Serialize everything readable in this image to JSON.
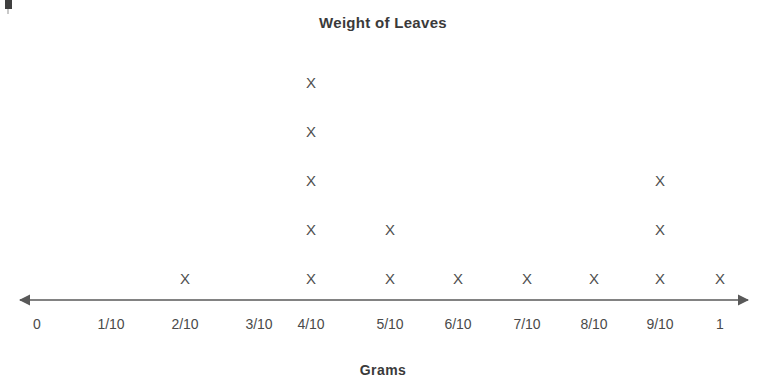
{
  "chart_data": {
    "type": "scatter",
    "plot_style": "dot-plot",
    "title": "Weight of Leaves",
    "xlabel": "Grams",
    "ylabel": "",
    "grid": false,
    "legend": null,
    "categories": [
      "0",
      "1/10",
      "2/10",
      "3/10",
      "4/10",
      "5/10",
      "6/10",
      "7/10",
      "8/10",
      "9/10",
      "1"
    ],
    "x": [
      0,
      0.1,
      0.2,
      0.3,
      0.4,
      0.5,
      0.6,
      0.7,
      0.8,
      0.9,
      1
    ],
    "values": [
      0,
      0,
      1,
      0,
      5,
      2,
      1,
      1,
      1,
      3,
      1
    ],
    "counts": [
      {
        "category": "0",
        "x": 0,
        "count": 0
      },
      {
        "category": "1/10",
        "x": 0.1,
        "count": 0
      },
      {
        "category": "2/10",
        "x": 0.2,
        "count": 1
      },
      {
        "category": "3/10",
        "x": 0.3,
        "count": 0
      },
      {
        "category": "4/10",
        "x": 0.4,
        "count": 5
      },
      {
        "category": "5/10",
        "x": 0.5,
        "count": 2
      },
      {
        "category": "6/10",
        "x": 0.6,
        "count": 1
      },
      {
        "category": "7/10",
        "x": 0.7,
        "count": 1
      },
      {
        "category": "8/10",
        "x": 0.8,
        "count": 1
      },
      {
        "category": "9/10",
        "x": 0.9,
        "count": 3
      },
      {
        "category": "1",
        "x": 1,
        "count": 1
      }
    ],
    "total_observations": 15,
    "marker": "X",
    "xlim": [
      0,
      1
    ],
    "ylim": [
      0,
      5
    ],
    "colors": {
      "marker": "#4f4f4f",
      "axis": "#595959",
      "title": "#3a3a3a",
      "tick_label": "#4a4a4a",
      "background": "#ffffff"
    }
  },
  "axis": {
    "arrow_both_ends": true,
    "pixel_geometry": {
      "line_y": 300,
      "line_x_start": 13,
      "line_x_end": 755,
      "row_spacing": 49,
      "first_row_y": 271,
      "column_centers": [
        37,
        111,
        185,
        259,
        311,
        390,
        458,
        527,
        594,
        660,
        720
      ]
    }
  }
}
